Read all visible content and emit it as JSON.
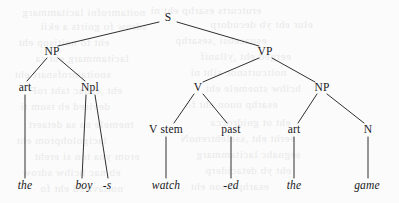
{
  "figure": {
    "name": "phrase-structure-tree",
    "type": "syntax-tree",
    "width": 399,
    "height": 203,
    "background_color": "#fbfbfb",
    "ink_color": "#18181a",
    "sentence": "the boy -s watch -ed the game"
  },
  "nodes": [
    {
      "id": "S",
      "label": "S",
      "x": 168,
      "y": 18,
      "italic": false,
      "level": 0
    },
    {
      "id": "NP1",
      "label": "NP",
      "x": 52,
      "y": 52,
      "italic": false,
      "level": 1
    },
    {
      "id": "VP",
      "label": "VP",
      "x": 265,
      "y": 52,
      "italic": false,
      "level": 1
    },
    {
      "id": "art1",
      "label": "art",
      "x": 25,
      "y": 88,
      "italic": false,
      "level": 2
    },
    {
      "id": "Npl",
      "label": "Npl",
      "x": 90,
      "y": 88,
      "italic": false,
      "level": 2
    },
    {
      "id": "V",
      "label": "V",
      "x": 198,
      "y": 88,
      "italic": false,
      "level": 2
    },
    {
      "id": "NP2",
      "label": "NP",
      "x": 322,
      "y": 88,
      "italic": false,
      "level": 2
    },
    {
      "id": "Vstem",
      "label": "V stem",
      "x": 166,
      "y": 130,
      "italic": false,
      "level": 3
    },
    {
      "id": "past",
      "label": "past",
      "x": 231,
      "y": 130,
      "italic": false,
      "level": 3
    },
    {
      "id": "art2",
      "label": "art",
      "x": 294,
      "y": 130,
      "italic": false,
      "level": 3
    },
    {
      "id": "N",
      "label": "N",
      "x": 368,
      "y": 130,
      "italic": false,
      "level": 3
    },
    {
      "id": "the1",
      "label": "the",
      "x": 25,
      "y": 186,
      "italic": true,
      "level": 4
    },
    {
      "id": "boy",
      "label": "boy",
      "x": 84,
      "y": 186,
      "italic": true,
      "level": 4
    },
    {
      "id": "s",
      "label": "-s",
      "x": 107,
      "y": 186,
      "italic": true,
      "level": 4
    },
    {
      "id": "watch",
      "label": "watch",
      "x": 166,
      "y": 186,
      "italic": true,
      "level": 4
    },
    {
      "id": "ed",
      "label": "-ed",
      "x": 231,
      "y": 186,
      "italic": true,
      "level": 4
    },
    {
      "id": "the2",
      "label": "the",
      "x": 294,
      "y": 186,
      "italic": true,
      "level": 4
    },
    {
      "id": "game",
      "label": "game",
      "x": 367,
      "y": 186,
      "italic": true,
      "level": 4
    }
  ],
  "edges": [
    {
      "from": "S",
      "to": "NP1",
      "x1": 159,
      "y1": 22,
      "x2": 58,
      "y2": 46
    },
    {
      "from": "S",
      "to": "VP",
      "x1": 177,
      "y1": 22,
      "x2": 259,
      "y2": 46
    },
    {
      "from": "NP1",
      "to": "art1",
      "x1": 47,
      "y1": 58,
      "x2": 27,
      "y2": 81
    },
    {
      "from": "NP1",
      "to": "Npl",
      "x1": 58,
      "y1": 58,
      "x2": 85,
      "y2": 81
    },
    {
      "from": "VP",
      "to": "V",
      "x1": 259,
      "y1": 58,
      "x2": 203,
      "y2": 82
    },
    {
      "from": "VP",
      "to": "NP2",
      "x1": 272,
      "y1": 58,
      "x2": 315,
      "y2": 82
    },
    {
      "from": "art1",
      "to": "the1",
      "x1": 25,
      "y1": 95,
      "x2": 25,
      "y2": 178
    },
    {
      "from": "Npl",
      "to": "boy",
      "x1": 86,
      "y1": 95,
      "x2": 82,
      "y2": 178
    },
    {
      "from": "Npl",
      "to": "s",
      "x1": 95,
      "y1": 95,
      "x2": 108,
      "y2": 178
    },
    {
      "from": "V",
      "to": "Vstem",
      "x1": 194,
      "y1": 94,
      "x2": 174,
      "y2": 123
    },
    {
      "from": "V",
      "to": "past",
      "x1": 203,
      "y1": 94,
      "x2": 227,
      "y2": 123
    },
    {
      "from": "NP2",
      "to": "art2",
      "x1": 317,
      "y1": 94,
      "x2": 298,
      "y2": 123
    },
    {
      "from": "NP2",
      "to": "N",
      "x1": 327,
      "y1": 94,
      "x2": 364,
      "y2": 123
    },
    {
      "from": "Vstem",
      "to": "watch",
      "x1": 166,
      "y1": 137,
      "x2": 166,
      "y2": 178
    },
    {
      "from": "past",
      "to": "ed",
      "x1": 231,
      "y1": 137,
      "x2": 231,
      "y2": 178
    },
    {
      "from": "art2",
      "to": "the2",
      "x1": 294,
      "y1": 137,
      "x2": 294,
      "y2": 178
    },
    {
      "from": "N",
      "to": "game",
      "x1": 368,
      "y1": 137,
      "x2": 368,
      "y2": 178
    }
  ],
  "bleed_lines": [
    {
      "text": "noitamrofni lacitammarg",
      "x": 22,
      "y": 6
    },
    {
      "text": "erutcurts esarhp eht ni",
      "x": 150,
      "y": 4
    },
    {
      "text": "sdrow fo gnirts a ekil",
      "x": 40,
      "y": 20
    },
    {
      "text": "elur eht yb decudorp",
      "x": 210,
      "y": 18
    },
    {
      "text": "eht fo noitisop eht",
      "x": 18,
      "y": 36
    },
    {
      "text": "esuacebsi ,sesarhp",
      "x": 175,
      "y": 34
    },
    {
      "text": "lacitammarg eht sa",
      "x": 35,
      "y": 52
    },
    {
      "text": "eerged eht ,yllanif",
      "x": 200,
      "y": 50
    },
    {
      "text": "snoitamrofsnart eht",
      "x": 14,
      "y": 68
    },
    {
      "text": "noitcurtsnoc siht ni",
      "x": 190,
      "y": 66
    },
    {
      "text": "eht ,esuac taht roF",
      "x": 30,
      "y": 84
    },
    {
      "text": "hcihw stnemele eht",
      "x": 205,
      "y": 82
    },
    {
      "text": "devired eb tsum ti",
      "x": 20,
      "y": 100
    },
    {
      "text": "esarhp nuon eht fo",
      "x": 185,
      "y": 98
    },
    {
      "text": "tnemele na sa detaert",
      "x": 28,
      "y": 118
    },
    {
      "text": "eht ot gnidrocca",
      "x": 210,
      "y": 116
    },
    {
      "text": "lacigolohprom eht",
      "x": 16,
      "y": 134
    },
    {
      "text": "eerht eht ,sselehtrenoN",
      "x": 180,
      "y": 132
    },
    {
      "text": "erom yna ton si ereht",
      "x": 34,
      "y": 150
    },
    {
      "text": "segnahc lacitammarg",
      "x": 196,
      "y": 148
    },
    {
      "text": "eb nac hcihw sdrow",
      "x": 22,
      "y": 166
    },
    {
      "text": "eht yb detaciderp",
      "x": 205,
      "y": 164
    },
    {
      "text": "noitavired eht fo",
      "x": 40,
      "y": 182
    },
    {
      "text": "esarhp nuon eht",
      "x": 190,
      "y": 180
    }
  ]
}
